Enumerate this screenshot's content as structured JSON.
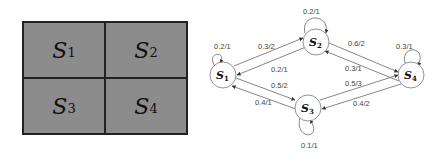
{
  "grid": {
    "cells": [
      {
        "label": "S",
        "sub": "1"
      },
      {
        "label": "S",
        "sub": "2"
      },
      {
        "label": "S",
        "sub": "3"
      },
      {
        "label": "S",
        "sub": "4"
      }
    ]
  },
  "state_diagram": {
    "nodes": [
      {
        "id": "S1",
        "label": "S",
        "sub": "1"
      },
      {
        "id": "S2",
        "label": "S",
        "sub": "2"
      },
      {
        "id": "S3",
        "label": "S",
        "sub": "3"
      },
      {
        "id": "S4",
        "label": "S",
        "sub": "4"
      }
    ],
    "edges": [
      {
        "from": "S1",
        "to": "S1",
        "label": "0.2/1"
      },
      {
        "from": "S2",
        "to": "S2",
        "label": "0.2/1"
      },
      {
        "from": "S4",
        "to": "S4",
        "label": "0.3/1"
      },
      {
        "from": "S3",
        "to": "S3",
        "label": "0.1/1"
      },
      {
        "from": "S1",
        "to": "S2",
        "label": "0.3/2"
      },
      {
        "from": "S2",
        "to": "S1",
        "label": "0.2/1"
      },
      {
        "from": "S2",
        "to": "S4",
        "label": "0.6/2"
      },
      {
        "from": "S4",
        "to": "S2",
        "label": "0.3/1"
      },
      {
        "from": "S1",
        "to": "S3",
        "label": "0.5/2"
      },
      {
        "from": "S3",
        "to": "S1",
        "label": "0.4/1"
      },
      {
        "from": "S3",
        "to": "S4",
        "label": "0.5/3"
      },
      {
        "from": "S4",
        "to": "S3",
        "label": "0.4/2"
      }
    ]
  }
}
